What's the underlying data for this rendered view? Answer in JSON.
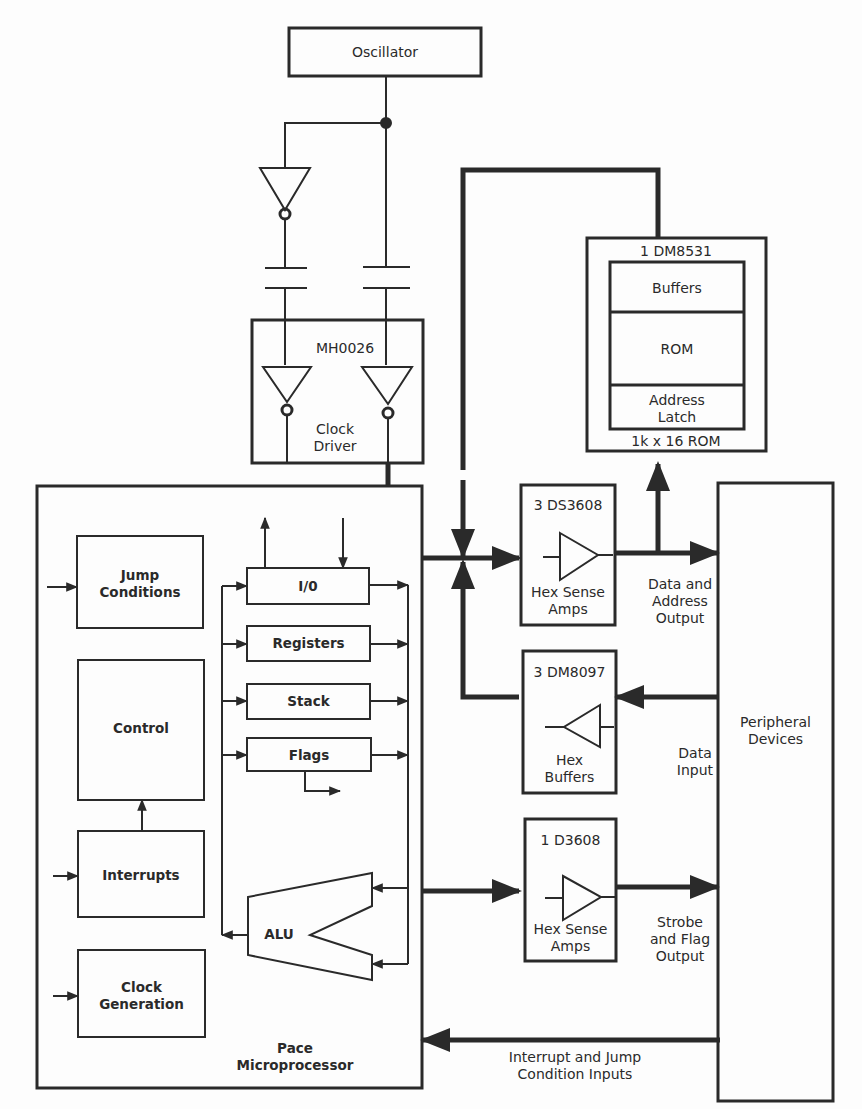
{
  "diagram": {
    "type": "block-diagram",
    "colors": {
      "ink": "#2a2a2a",
      "paper": "#fdfdfd"
    },
    "oscillator": {
      "label": "Oscillator"
    },
    "clock_driver": {
      "part": "MH0026",
      "label": "Clock\nDriver"
    },
    "rom": {
      "part": "1 DM8531",
      "sections": [
        "Buffers",
        "ROM",
        "Address\nLatch"
      ],
      "caption": "1k x 16 ROM"
    },
    "sense_amps_top": {
      "part": "3 DS3608",
      "label": "Hex Sense\nAmps",
      "output_label": "Data and\nAddress\nOutput"
    },
    "hex_buffers": {
      "part": "3 DM8097",
      "label": "Hex\nBuffers",
      "input_label": "Data\nInput"
    },
    "sense_amps_bottom": {
      "part": "1 D3608",
      "label": "Hex Sense\nAmps",
      "output_label": "Strobe\nand Flag\nOutput"
    },
    "peripheral": {
      "label": "Peripheral\nDevices"
    },
    "interrupt_bus": {
      "label": "Interrupt and Jump\nCondition Inputs"
    },
    "microprocessor": {
      "label": "Pace\nMicroprocessor",
      "left_blocks": [
        "Jump\nConditions",
        "Control",
        "Interrupts",
        "Clock\nGeneration"
      ],
      "registers": [
        "I/0",
        "Registers",
        "Stack",
        "Flags"
      ],
      "alu": "ALU"
    }
  }
}
